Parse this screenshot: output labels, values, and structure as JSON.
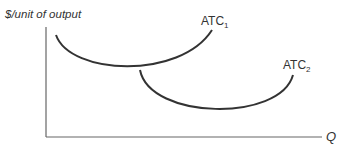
{
  "diagram": {
    "y_axis_label": "$/unit of output",
    "x_axis_label": "Q",
    "curves": [
      {
        "name": "ATC",
        "subscript": "1"
      },
      {
        "name": "ATC",
        "subscript": "2"
      }
    ],
    "colors": {
      "curve": "#333333",
      "axis": "#555555",
      "text": "#333333"
    }
  }
}
